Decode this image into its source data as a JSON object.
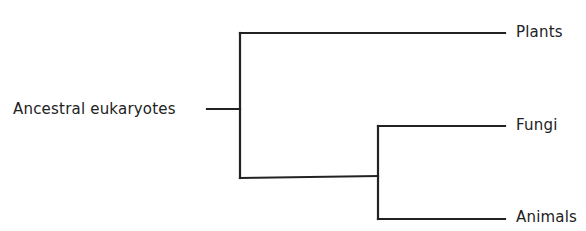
{
  "diagram": {
    "type": "phylogenetic-tree",
    "root": {
      "label": "Ancestral eukaryotes"
    },
    "leaves": [
      {
        "label": "Plants"
      },
      {
        "label": "Fungi"
      },
      {
        "label": "Animals"
      }
    ],
    "edges": [
      {
        "from": "Ancestral eukaryotes",
        "to": "node-1"
      },
      {
        "from": "node-1",
        "to": "Plants"
      },
      {
        "from": "node-1",
        "to": "node-2"
      },
      {
        "from": "node-2",
        "to": "Fungi"
      },
      {
        "from": "node-2",
        "to": "Animals"
      }
    ],
    "line_color": "#222222"
  }
}
